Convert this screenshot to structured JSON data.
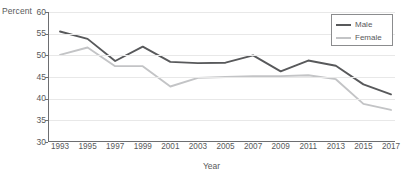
{
  "chart_data": {
    "type": "line",
    "title": "",
    "xlabel": "Year",
    "ylabel": "Percent",
    "ylim": [
      30,
      60
    ],
    "xlim": [
      1993,
      2017
    ],
    "grid": true,
    "legend_position": "top-right",
    "yticks": [
      60,
      55,
      50,
      45,
      40,
      35,
      30
    ],
    "categories": [
      1993,
      1995,
      1997,
      1999,
      2001,
      2003,
      2005,
      2007,
      2009,
      2011,
      2013,
      2015,
      2017
    ],
    "x": [
      "1993",
      "1995",
      "1997",
      "1999",
      "2001",
      "2003",
      "2005",
      "2007",
      "2009",
      "2011",
      "2013",
      "2015",
      "2017"
    ],
    "series": [
      {
        "name": "Male",
        "color": "#58595b",
        "values": [
          55.5,
          53.8,
          48.7,
          52.0,
          48.5,
          48.2,
          48.3,
          50.0,
          46.3,
          48.8,
          47.6,
          43.3,
          41.0
        ]
      },
      {
        "name": "Female",
        "color": "#c3c4c6",
        "values": [
          50.1,
          51.8,
          47.5,
          47.5,
          42.8,
          44.8,
          45.0,
          45.2,
          45.2,
          45.4,
          44.5,
          38.8,
          37.4
        ]
      }
    ]
  },
  "axes": {
    "y_title": "Percent",
    "x_title": "Year"
  },
  "legend": {
    "items": [
      {
        "label": "Male",
        "color": "#58595b"
      },
      {
        "label": "Female",
        "color": "#c3c4c6"
      }
    ]
  }
}
